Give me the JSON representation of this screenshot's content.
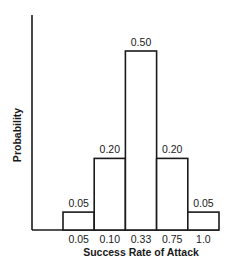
{
  "chart_data": {
    "type": "bar",
    "title": "",
    "xlabel": "Success Rate of Attack",
    "ylabel": "Probability",
    "categories": [
      "0.05",
      "0.10",
      "0.33",
      "0.75",
      "1.0"
    ],
    "values": [
      0.05,
      0.2,
      0.5,
      0.2,
      0.05
    ],
    "value_labels": [
      "0.05",
      "0.20",
      "0.50",
      "0.20",
      "0.05"
    ],
    "ylim": [
      0,
      0.6
    ],
    "grid": false,
    "legend": null,
    "bar_fill": "#ffffff",
    "bar_stroke": "#1a1a1a"
  }
}
